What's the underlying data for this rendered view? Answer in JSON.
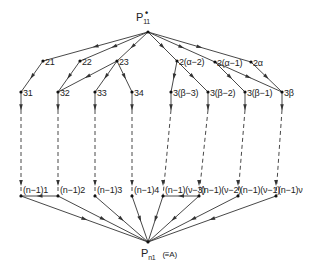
{
  "diagram": {
    "type": "directed-graph",
    "source": {
      "id": "P11",
      "label_main": "P",
      "label_sub": "11",
      "label_sup": "•",
      "x": 148,
      "y": 32
    },
    "sink": {
      "id": "Pn1",
      "label_main": "P",
      "label_sub": "n1",
      "note": "(≡A)",
      "x": 148,
      "y": 242
    },
    "row2": [
      {
        "id": "21",
        "label": "21",
        "x": 43,
        "y": 61
      },
      {
        "id": "22",
        "label": "22",
        "x": 80,
        "y": 61
      },
      {
        "id": "23",
        "label": "23",
        "x": 117,
        "y": 61
      },
      {
        "id": "2a-2",
        "label": "2(α−2)",
        "x": 177,
        "y": 61
      },
      {
        "id": "2a-1",
        "label": "2(α−1)",
        "x": 215,
        "y": 62
      },
      {
        "id": "2a",
        "label": "2α",
        "x": 251,
        "y": 62
      }
    ],
    "row3": [
      {
        "id": "31",
        "label": "31",
        "x": 21,
        "y": 92
      },
      {
        "id": "32",
        "label": "32",
        "x": 58,
        "y": 92
      },
      {
        "id": "33",
        "label": "33",
        "x": 95,
        "y": 92
      },
      {
        "id": "34",
        "label": "34",
        "x": 132,
        "y": 92
      },
      {
        "id": "3b-3",
        "label": "3(β−3)",
        "x": 171,
        "y": 92
      },
      {
        "id": "3b-2",
        "label": "3(β−2)",
        "x": 208,
        "y": 92
      },
      {
        "id": "3b-1",
        "label": "3(β−1)",
        "x": 245,
        "y": 92
      },
      {
        "id": "3b",
        "label": "3β",
        "x": 282,
        "y": 92
      }
    ],
    "rowN1": [
      {
        "id": "n1-1",
        "label": "(n−1)1",
        "x": 21,
        "y": 196
      },
      {
        "id": "n1-2",
        "label": "(n−1)2",
        "x": 58,
        "y": 196
      },
      {
        "id": "n1-3",
        "label": "(n−1)3",
        "x": 95,
        "y": 196
      },
      {
        "id": "n1-4",
        "label": "(n−1)4",
        "x": 132,
        "y": 196
      },
      {
        "id": "n1-v-3",
        "label": "(n−1)(ν−3)",
        "x": 163,
        "y": 196
      },
      {
        "id": "n1-v-2",
        "label": "(n−1)(ν−2)",
        "x": 199,
        "y": 196
      },
      {
        "id": "n1-v-1",
        "label": "(n−1)(ν−1)",
        "x": 238,
        "y": 196
      },
      {
        "id": "n1-v",
        "label": "(n−1)ν",
        "x": 276,
        "y": 196
      }
    ],
    "edges": [
      [
        "P11",
        "21"
      ],
      [
        "P11",
        "22"
      ],
      [
        "P11",
        "23"
      ],
      [
        "P11",
        "2a-2"
      ],
      [
        "P11",
        "2a-1"
      ],
      [
        "P11",
        "2a"
      ],
      [
        "21",
        "31"
      ],
      [
        "22",
        "32"
      ],
      [
        "23",
        "32"
      ],
      [
        "23",
        "33"
      ],
      [
        "23",
        "34"
      ],
      [
        "2a-2",
        "3b-3"
      ],
      [
        "2a-2",
        "3b-2"
      ],
      [
        "2a-1",
        "3b-1"
      ],
      [
        "2a-1",
        "3b"
      ],
      [
        "2a",
        "3b"
      ],
      [
        "n1-2",
        "n1-1"
      ],
      [
        "n1-v-2",
        "n1-v-3"
      ],
      [
        "n1-1",
        "Pn1"
      ],
      [
        "n1-2",
        "Pn1"
      ],
      [
        "n1-3",
        "Pn1"
      ],
      [
        "n1-4",
        "Pn1"
      ],
      [
        "n1-v-3",
        "Pn1"
      ],
      [
        "n1-v-2",
        "Pn1"
      ],
      [
        "n1-v-1",
        "Pn1"
      ],
      [
        "n1-v",
        "Pn1"
      ]
    ],
    "colors": {
      "line": "#333333",
      "node": "#111111",
      "background": "#ffffff"
    }
  }
}
